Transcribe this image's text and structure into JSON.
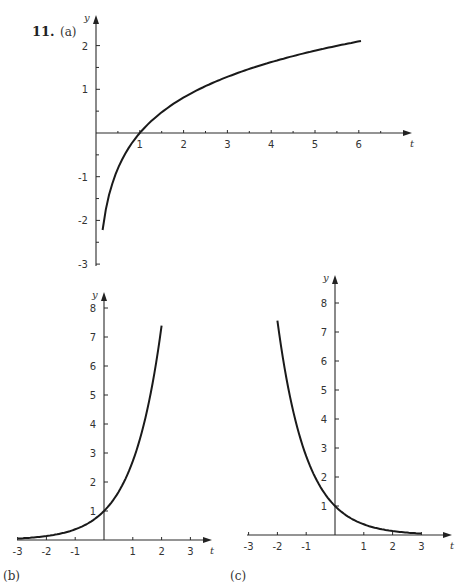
{
  "problem_number": "11.",
  "chart_data": [
    {
      "panel": "(a)",
      "type": "line",
      "xlabel": "t",
      "ylabel": "y",
      "x_ticks": [
        1,
        2,
        3,
        4,
        5,
        6
      ],
      "y_ticks": [
        -3,
        -1,
        -2,
        1,
        2
      ],
      "xlim": [
        0,
        6.5
      ],
      "ylim": [
        -3,
        2.6
      ],
      "description": "logarithmic curve crossing t-axis at t=1",
      "x": [
        0.15,
        0.3,
        0.5,
        0.75,
        1,
        1.5,
        2,
        3,
        4,
        5,
        6
      ],
      "y": [
        -2.36,
        -1.41,
        -0.81,
        -0.34,
        0,
        0.47,
        0.81,
        1.29,
        1.62,
        1.88,
        2.1
      ]
    },
    {
      "panel": "(b)",
      "type": "line",
      "xlabel": "t",
      "ylabel": "y",
      "x_ticks": [
        -3,
        -2,
        -1,
        1,
        2,
        3
      ],
      "y_ticks": [
        1,
        2,
        3,
        4,
        5,
        6,
        7,
        8
      ],
      "xlim": [
        -3,
        3.5
      ],
      "ylim": [
        0,
        8.5
      ],
      "description": "increasing exponential through (0,1)",
      "x": [
        -3,
        -2,
        -1,
        -0.5,
        0,
        0.5,
        1,
        1.5,
        2
      ],
      "y": [
        0.05,
        0.14,
        0.37,
        0.61,
        1,
        1.65,
        2.72,
        4.48,
        7.39
      ]
    },
    {
      "panel": "(c)",
      "type": "line",
      "xlabel": "t",
      "ylabel": "y",
      "x_ticks": [
        -3,
        -2,
        -1,
        1,
        2,
        3
      ],
      "y_ticks": [
        1,
        2,
        3,
        4,
        5,
        6,
        7,
        8
      ],
      "xlim": [
        -3,
        3.5
      ],
      "ylim": [
        0,
        8.5
      ],
      "description": "decreasing exponential through (0,1)",
      "x": [
        -2,
        -1.5,
        -1,
        -0.5,
        0,
        0.5,
        1,
        2,
        3
      ],
      "y": [
        7.39,
        4.48,
        2.72,
        1.65,
        1,
        0.61,
        0.37,
        0.14,
        0.05
      ]
    }
  ],
  "labels": {
    "a": "(a)",
    "b": "(b)",
    "c": "(c)",
    "t": "t",
    "y": "y"
  }
}
